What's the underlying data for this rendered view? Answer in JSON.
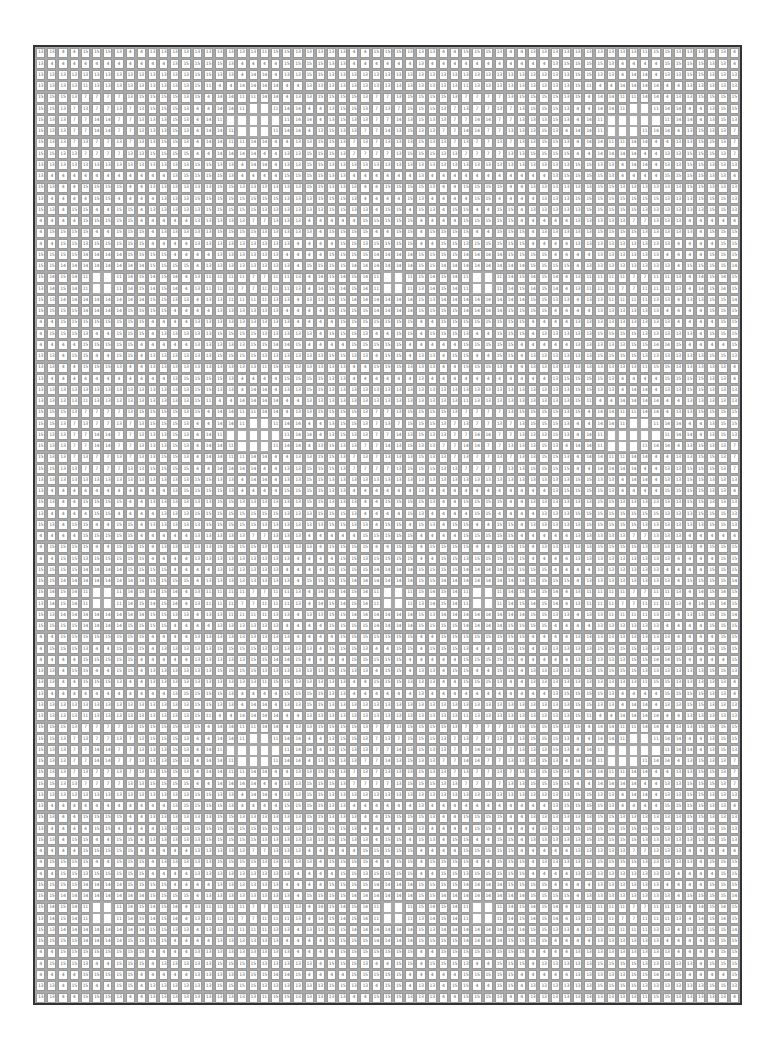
{
  "puzzle": {
    "type": "paint-by-numbers grid",
    "columns": 63,
    "rows": 85,
    "legend_values": [
      "4",
      "7",
      "11",
      "13",
      "14",
      "15"
    ],
    "blank_marker": "",
    "tile_rows": [
      "13,13,4,4,15,15,15,13,4,4,13,13,13,13,13,13,13,13,13,13,11,15,15,13,13,13,13,13,4,4,15,15,15,13",
      "13,4,4,4,4,4,4,4,4,4,4,4,13,15,15,15,15,13,4,4,4,4,15,15,15,15,13,13,4,4,4,4,4,4",
      "13,13,13,13,13,13,13,13,13,13,13,13,13,13,15,15,13,13,4,14,14,4,13,13,15,15,13,13,13,13,13,13,13,13",
      "13,13,13,13,11,13,13,13,13,13,13,13,13,13,15,11,4,4,14,14,14,14,4,4,13,13,13,13,13,13,13,13,13,13",
      "15,15,15,13,7,7,7,7,13,15,15,15,15,13,15,4,14,14,11,11,14,14,4,13,13,15,15,15,15,13,7,7,13,15",
      "15,15,13,7,13,7,7,13,7,13,15,15,15,13,4,4,14,14,11,,,11,14,14,4,4,13,15,15,13,7,13,7,15",
      "15,13,13,7,7,14,14,7,7,13,13,13,15,13,4,14,11,,,,,,11,14,14,4,13,15,13,13,7,7,14,13",
      "15,13,13,7,7,14,14,7,7,13,13,13,15,13,4,14,14,11,,,,11,14,14,4,13,15,13,13,7,7,14,13",
      "15,13,13,7,13,7,7,13,7,13,13,15,15,13,4,14,14,11,11,14,14,4,4,13,13,15,15,13,7,13,7,13,13,13",
      "15,15,13,13,7,7,7,7,13,13,15,15,15,15,4,4,14,14,14,14,4,4,13,13,15,15,15,13,7,7,7,7,13,15",
      "13,13,13,13,13,13,13,13,13,13,13,13,13,13,15,15,13,13,4,14,14,4,13,13,15,15,13,13,13,13,13,13,13,13",
      "13,4,4,4,4,4,4,4,4,4,4,4,13,15,15,15,15,13,4,4,4,4,15,15,15,15,13,13,4,4,4,4,4,4",
      "15,13,4,4,15,15,15,15,4,4,13,13,13,13,13,13,15,15,13,13,13,13,13,13,15,15,13,13,13,4,4,15,15,15",
      "13,4,4,4,4,15,15,4,4,4,4,13,13,13,15,15,15,15,15,15,15,15,13,13,13,15,15,15,13,4,4,4,4,15",
      "15,13,4,15,15,4,4,15,15,4,13,13,13,13,13,15,15,15,15,15,13,13,13,13,13,13,15,15,13,13,4,15,15,4",
      "4,4,4,4,15,15,15,15,15,4,4,4,4,4,13,13,13,13,13,7,7,13,13,13,4,4,4,4,4,15,15,15,15,15",
      "4,15,15,15,15,4,4,15,15,15,4,13,13,13,13,13,15,15,15,15,13,13,13,13,13,4,15,15,15,15,4,4,15,15",
      "4,4,15,15,13,15,15,15,15,15,4,4,4,4,13,13,13,13,13,13,13,13,13,4,4,4,4,15,15,13,15,15,15,15",
      "15,15,15,15,14,14,14,14,15,15,15,15,4,4,4,4,13,13,13,13,13,13,4,4,4,4,15,15,15,15,14,14,14,14",
      "15,15,14,14,14,14,14,14,14,14,15,15,15,15,4,13,13,13,13,13,13,13,13,4,15,15,15,15,14,14,14,14,14,14",
      "15,14,15,14,11,,,11,14,15,14,15,14,4,13,11,11,11,11,7,7,11,11,13,4,14,15,14,15,14,11,,,11",
      "13,14,15,14,11,,,11,14,15,14,15,14,4,13,11,11,11,7,7,11,11,11,13,4,14,15,14,15,14,11,,,11",
      "15,13,14,14,14,14,14,14,14,14,15,15,13,13,4,13,13,11,11,11,11,13,13,4,13,13,15,15,14,14,14,14,14,14",
      "15,15,15,15,14,14,14,14,15,15,15,15,4,4,4,4,13,13,13,13,13,13,4,4,4,4,15,15,15,15,14,14,14,14",
      "4,4,15,15,15,15,15,15,15,15,4,4,4,4,13,13,13,13,13,13,13,13,13,4,4,4,4,15,15,15,15,15,15,15",
      "4,15,15,15,13,4,4,15,15,15,4,13,13,13,13,13,15,15,15,15,13,13,13,13,13,4,15,15,15,13,4,4,15,15",
      "4,4,4,4,15,15,15,15,15,4,4,4,4,4,13,13,13,13,13,15,15,14,14,15,4,4,4,4,15,15,15,15,15,4",
      "13,13,4,15,15,4,4,15,15,4,13,13,13,13,13,13,15,15,15,15,13,13,13,13,13,13,15,15,13,13,4,15,15,4"
    ]
  }
}
